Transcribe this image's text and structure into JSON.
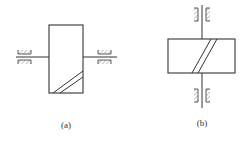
{
  "figure": {
    "stroke_color": "#333333",
    "hatch_color": "#888888",
    "background": "#ffffff"
  },
  "diagrams": [
    {
      "id": "a",
      "label": "(a)",
      "orientation": "horizontal-shaft",
      "description": "Gear/worm body with horizontal shaft supported by two bearings; helical teeth marking at bottom-right"
    },
    {
      "id": "b",
      "label": "(b)",
      "orientation": "vertical-shaft",
      "description": "Gear body with vertical shaft supported by two bearings; helical teeth marking across center"
    }
  ]
}
